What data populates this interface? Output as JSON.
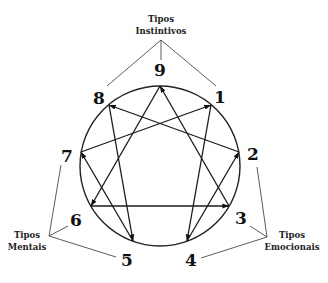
{
  "diagram": {
    "type": "enneagram",
    "circle": {
      "cx": 160,
      "cy": 166,
      "r": 80
    },
    "points": [
      {
        "label": "9",
        "x": 160,
        "y": 86,
        "lx": 160,
        "ly": 76
      },
      {
        "label": "1",
        "x": 211,
        "y": 105,
        "lx": 220,
        "ly": 103
      },
      {
        "label": "2",
        "x": 239,
        "y": 152,
        "lx": 253,
        "ly": 160
      },
      {
        "label": "3",
        "x": 229,
        "y": 206,
        "lx": 241,
        "ly": 224
      },
      {
        "label": "4",
        "x": 187,
        "y": 241,
        "lx": 191,
        "ly": 266
      },
      {
        "label": "5",
        "x": 133,
        "y": 241,
        "lx": 127,
        "ly": 266
      },
      {
        "label": "6",
        "x": 91,
        "y": 206,
        "lx": 76,
        "ly": 226
      },
      {
        "label": "7",
        "x": 81,
        "y": 152,
        "lx": 67,
        "ly": 162
      },
      {
        "label": "8",
        "x": 109,
        "y": 105,
        "lx": 99,
        "ly": 104
      }
    ],
    "arrows": [
      {
        "from": "9",
        "to": "6"
      },
      {
        "from": "3",
        "to": "9"
      },
      {
        "from": "1",
        "to": "4"
      },
      {
        "from": "2",
        "to": "8"
      },
      {
        "from": "4",
        "to": "2"
      },
      {
        "from": "5",
        "to": "7"
      },
      {
        "from": "7",
        "to": "1"
      },
      {
        "from": "8",
        "to": "5"
      },
      {
        "from": "6",
        "to": "3"
      }
    ],
    "groups": [
      {
        "name": "instintivos",
        "label_line1": "Tipos",
        "label_line2": "Instintivos",
        "label_x": 161,
        "label_y1": 22,
        "label_y2": 34,
        "hub": {
          "x": 161,
          "y": 40
        },
        "members": [
          "8",
          "9",
          "1"
        ],
        "ends": [
          {
            "x": 107,
            "y": 86
          },
          {
            "x": 161,
            "y": 60
          },
          {
            "x": 216,
            "y": 86
          }
        ]
      },
      {
        "name": "mentais",
        "label_line1": "Tipos",
        "label_line2": "Mentais",
        "label_x": 27,
        "label_y1": 238,
        "label_y2": 250,
        "hub": {
          "x": 49,
          "y": 236
        },
        "members": [
          "7",
          "6",
          "5"
        ],
        "ends": [
          {
            "x": 61,
            "y": 165
          },
          {
            "x": 68,
            "y": 226
          },
          {
            "x": 116,
            "y": 257
          }
        ]
      },
      {
        "name": "emocionais",
        "label_line1": "Tipos",
        "label_line2": "Emocionais",
        "label_x": 292,
        "label_y1": 238,
        "label_y2": 250,
        "hub": {
          "x": 267,
          "y": 237
        },
        "members": [
          "2",
          "3",
          "4"
        ],
        "ends": [
          {
            "x": 257,
            "y": 167
          },
          {
            "x": 250,
            "y": 226
          },
          {
            "x": 201,
            "y": 258
          }
        ]
      }
    ]
  }
}
